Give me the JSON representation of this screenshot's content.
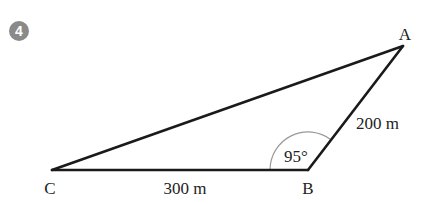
{
  "question": {
    "number": "4",
    "badge_color": "#8a8a8a"
  },
  "diagram": {
    "type": "triangle",
    "line_color": "#1a1a1a",
    "arc_color": "#9a9a9a",
    "vertices": {
      "A": {
        "label": "A",
        "x": 403,
        "y": 46
      },
      "B": {
        "label": "B",
        "x": 308,
        "y": 170
      },
      "C": {
        "label": "C",
        "x": 52,
        "y": 170
      }
    },
    "sides": {
      "CB": {
        "label": "300 m"
      },
      "BA": {
        "label": "200 m"
      }
    },
    "angles": {
      "B": {
        "label": "95°"
      }
    }
  }
}
